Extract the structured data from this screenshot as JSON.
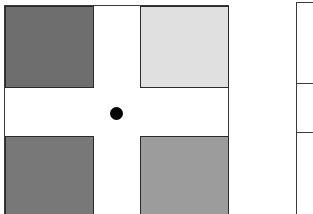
{
  "diagram": {
    "squares": [
      {
        "position": "top-left",
        "color": "#6e6e6e"
      },
      {
        "position": "top-right",
        "color": "#e0e0e0"
      },
      {
        "position": "bottom-left",
        "color": "#787878"
      },
      {
        "position": "bottom-right",
        "color": "#9c9c9c"
      }
    ],
    "fixation_dot_color": "#000000",
    "frame_color": "#3a3a3a",
    "right_panel": {
      "dividers": 2
    }
  }
}
